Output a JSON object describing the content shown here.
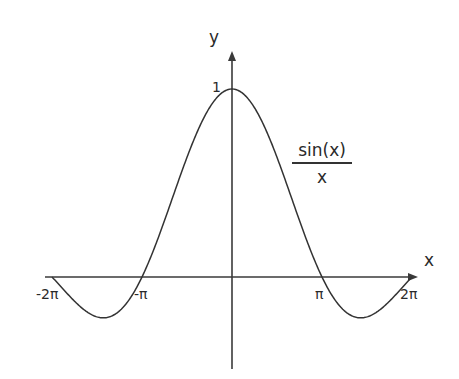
{
  "chart_data": {
    "type": "line",
    "title": "",
    "function": "sin(x)/x",
    "series": [
      {
        "name": "sin(x)/x",
        "x": [
          -6.283,
          -5.5,
          -4.493,
          -3.5,
          -3.142,
          -2.5,
          -2.0,
          -1.5,
          -1.0,
          -0.5,
          0,
          0.5,
          1.0,
          1.5,
          2.0,
          2.5,
          3.142,
          3.5,
          4.493,
          5.5,
          6.283
        ],
        "values": [
          0.0,
          -0.129,
          -0.217,
          -0.1,
          0.0,
          0.239,
          0.455,
          0.665,
          0.841,
          0.959,
          1.0,
          0.959,
          0.841,
          0.665,
          0.455,
          0.239,
          0.0,
          -0.1,
          -0.217,
          -0.129,
          0.0
        ]
      }
    ],
    "xlabel": "x",
    "ylabel": "y",
    "xlim": [
      -6.5,
      6.8
    ],
    "ylim": [
      -0.5,
      1.2
    ],
    "x_ticks": [
      {
        "value": -6.283,
        "label": "-2π"
      },
      {
        "value": -3.142,
        "label": "-π"
      },
      {
        "value": 3.142,
        "label": "π"
      },
      {
        "value": 6.283,
        "label": "2π"
      }
    ],
    "y_ticks": [
      {
        "value": 1,
        "label": "1"
      }
    ],
    "annotations": [
      {
        "text": "sin(x)/x",
        "numerator": "sin(x)",
        "denominator": "x",
        "position": "right of curve, near x=2"
      }
    ],
    "grid": false,
    "legend": "none"
  },
  "labels": {
    "x_axis": "x",
    "y_axis": "y",
    "tick_neg_2pi": "-2π",
    "tick_neg_pi": "-π",
    "tick_pi": "π",
    "tick_2pi": "2π",
    "tick_one": "1",
    "curve_numerator": "sin(x)",
    "curve_denominator": "x"
  },
  "colors": {
    "axis": "#3a3a3a",
    "curve": "#333333",
    "background": "#ffffff"
  }
}
